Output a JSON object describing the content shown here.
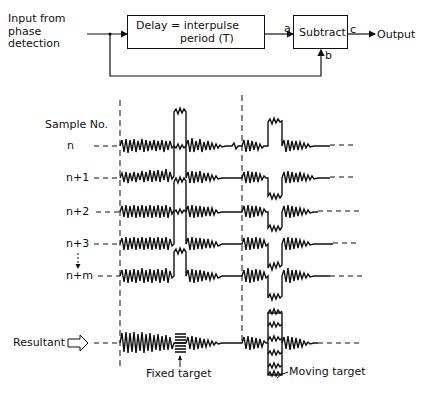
{
  "block_diagram": {
    "input_label_line1": "Input from",
    "input_label_line2": "phase",
    "input_label_line3": "detection",
    "delay_box_line1": "Delay = interpulse",
    "delay_box_line2": "period (T)",
    "subtract_box": "Subtract",
    "port_a": "a",
    "port_b": "b",
    "port_c": "c",
    "output_label": "Output"
  },
  "waveforms": {
    "axis_title": "Sample No.",
    "rows": [
      {
        "label": "n"
      },
      {
        "label": "n+1"
      },
      {
        "label": "n+2"
      },
      {
        "label": "n+3"
      },
      {
        "label": "n+m"
      }
    ],
    "resultant_label": "Resultant",
    "fixed_target_label": "Fixed target",
    "moving_target_label": "Moving target"
  }
}
